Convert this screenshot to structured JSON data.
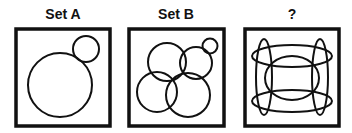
{
  "panels": [
    {
      "title": "Set A"
    },
    {
      "title": "Set B"
    },
    {
      "title": "?"
    }
  ],
  "colors": {
    "stroke": "#111111",
    "background": "#ffffff"
  }
}
